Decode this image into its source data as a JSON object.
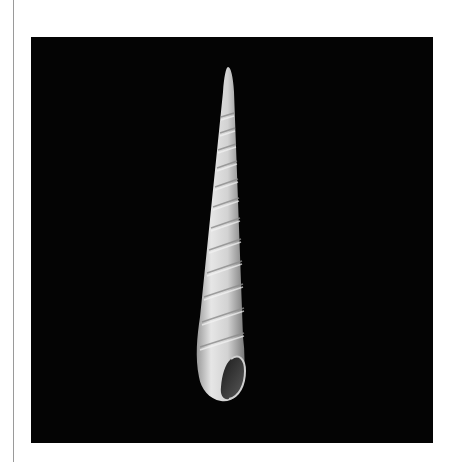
{
  "page": {
    "background": "#ffffff",
    "rule_color": "#9a9a9a"
  },
  "photo": {
    "subject": "Auger shell (Terebridae) on black background",
    "background": "#040404",
    "shell_color": "#d9d9d9"
  }
}
